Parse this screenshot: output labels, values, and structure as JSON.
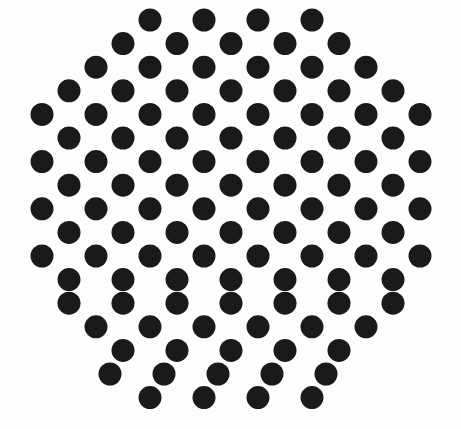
{
  "canvas": {
    "width": 461,
    "height": 429,
    "background_color": "#fdfdfc",
    "title": "hexagonal-dot-lattice"
  },
  "pattern": {
    "name": "hexagonal-close-packed-dot-array",
    "shape": "circular-hexagonal-boundary",
    "dot_color": "#1a1a1a",
    "dot_diameter": 23,
    "dot_radius": 11.5,
    "row_pitch": 23.6,
    "column_pitch": 54.2,
    "row_offset": 27.1,
    "row_count": 16,
    "dot_count": 109
  },
  "chart_data": {
    "type": "scatter",
    "title": "",
    "xlabel": "",
    "ylabel": "",
    "xlim": [
      0,
      461
    ],
    "ylim": [
      0,
      429
    ],
    "grid": false,
    "legend": false,
    "marker": "circle",
    "marker_size": 23,
    "marker_color": "#1a1a1a",
    "rows": [
      {
        "index": 0,
        "y": 20,
        "count": 4,
        "x": [
          150,
          204,
          258,
          312
        ]
      },
      {
        "index": 1,
        "y": 43.6,
        "count": 5,
        "x": [
          123,
          177,
          231,
          285,
          339
        ]
      },
      {
        "index": 2,
        "y": 67.2,
        "count": 6,
        "x": [
          96,
          150,
          204,
          258,
          312,
          366
        ]
      },
      {
        "index": 3,
        "y": 90.8,
        "count": 7,
        "x": [
          69,
          123,
          177,
          231,
          285,
          339,
          393
        ]
      },
      {
        "index": 4,
        "y": 114.4,
        "count": 8,
        "x": [
          42,
          96,
          150,
          204,
          258,
          312,
          366,
          420
        ]
      },
      {
        "index": 5,
        "y": 138.0,
        "count": 7,
        "x": [
          69,
          123,
          177,
          231,
          285,
          339,
          393
        ]
      },
      {
        "index": 6,
        "y": 161.6,
        "count": 8,
        "x": [
          42,
          96,
          150,
          204,
          258,
          312,
          366,
          420
        ]
      },
      {
        "index": 7,
        "y": 185.2,
        "count": 7,
        "x": [
          69,
          123,
          177,
          231,
          285,
          339,
          393
        ]
      },
      {
        "index": 8,
        "y": 208.8,
        "count": 8,
        "x": [
          42,
          96,
          150,
          204,
          258,
          312,
          366,
          420
        ]
      },
      {
        "index": 9,
        "y": 232.4,
        "count": 7,
        "x": [
          69,
          123,
          177,
          231,
          285,
          339,
          393
        ]
      },
      {
        "index": 10,
        "y": 256.0,
        "count": 8,
        "x": [
          42,
          96,
          150,
          204,
          258,
          312,
          366,
          420
        ]
      },
      {
        "index": 11,
        "y": 279.6,
        "count": 7,
        "x": [
          69,
          123,
          177,
          231,
          285,
          339,
          393
        ]
      },
      {
        "index": 12,
        "y": 303.2,
        "count": 7,
        "x": [
          69,
          123,
          177,
          231,
          285,
          339,
          393
        ]
      },
      {
        "index": 13,
        "y": 326.8,
        "count": 6,
        "x": [
          96,
          150,
          204,
          258,
          312,
          366
        ]
      },
      {
        "index": 14,
        "y": 350.4,
        "count": 5,
        "x": [
          123,
          177,
          231,
          285,
          339
        ]
      },
      {
        "index": 15,
        "y": 374.0,
        "count": 5,
        "x": [
          110,
          164,
          218,
          272,
          326
        ]
      },
      {
        "index": 16,
        "y": 397.6,
        "count": 4,
        "x": [
          150,
          204,
          258,
          312
        ]
      }
    ]
  }
}
